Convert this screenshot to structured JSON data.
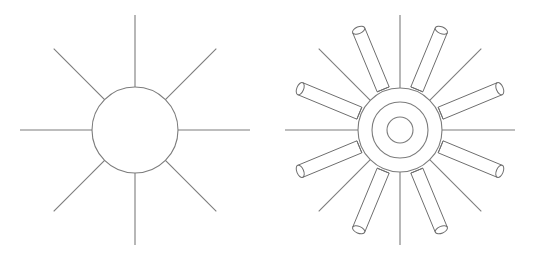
{
  "page": {
    "background_color": "#ffffff",
    "width": 538,
    "height": 260
  },
  "style": {
    "stroke_color": "#7c7c7c",
    "rod_stroke_color": "#6e6e6e",
    "rod_fill_color": "#ffffff",
    "thin_stroke_width": 1.1,
    "circle_stroke_width": 1.1,
    "rod_stroke_width": 1.0
  },
  "figures": [
    {
      "id": "simple-sun",
      "label": "Simple sun symbol",
      "center": {
        "x": 135,
        "y": 130
      },
      "circles": [
        {
          "name": "outer-circle",
          "radius": 43
        }
      ],
      "spokes": {
        "count": 8,
        "start_radius": 43,
        "end_radius": 115,
        "angles_deg": [
          0,
          45,
          90,
          135,
          180,
          225,
          270,
          315
        ]
      },
      "rods": []
    },
    {
      "id": "radiating-gear-sun",
      "label": "Sun with cylindrical rays",
      "center": {
        "x": 400,
        "y": 130
      },
      "circles": [
        {
          "name": "outer-circle",
          "radius": 42
        },
        {
          "name": "middle-circle",
          "radius": 28
        },
        {
          "name": "inner-circle",
          "radius": 13
        }
      ],
      "spokes": {
        "count": 8,
        "start_radius": 42,
        "end_radius": 115,
        "angles_deg": [
          0,
          45,
          90,
          135,
          180,
          225,
          270,
          315
        ]
      },
      "rods": {
        "count": 8,
        "angles_deg": [
          22.5,
          67.5,
          112.5,
          157.5,
          202.5,
          247.5,
          292.5,
          337.5
        ],
        "inner_radius": 44,
        "outer_radius": 108,
        "half_width": 6.5,
        "cap_ellipse_ry": 3.4
      }
    }
  ]
}
